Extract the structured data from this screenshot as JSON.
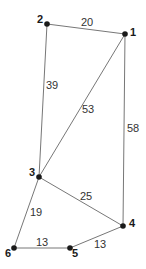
{
  "graph": {
    "nodes": [
      {
        "id": "1",
        "label": "1",
        "x": 125,
        "y": 34,
        "lx": 130,
        "ly": 36
      },
      {
        "id": "2",
        "label": "2",
        "x": 47,
        "y": 24,
        "lx": 37,
        "ly": 23
      },
      {
        "id": "3",
        "label": "3",
        "x": 39,
        "y": 177,
        "lx": 29,
        "ly": 176
      },
      {
        "id": "4",
        "label": "4",
        "x": 123,
        "y": 226,
        "lx": 129,
        "ly": 227
      },
      {
        "id": "5",
        "label": "5",
        "x": 70,
        "y": 248,
        "lx": 72,
        "ly": 257
      },
      {
        "id": "6",
        "label": "6",
        "x": 14,
        "y": 248,
        "lx": 5,
        "ly": 257
      }
    ],
    "edges": [
      {
        "from": "2",
        "to": "1",
        "weight": "20",
        "lx": 81,
        "ly": 26
      },
      {
        "from": "2",
        "to": "3",
        "weight": "39",
        "lx": 46,
        "ly": 89
      },
      {
        "from": "1",
        "to": "3",
        "weight": "53",
        "lx": 82,
        "ly": 113
      },
      {
        "from": "1",
        "to": "4",
        "weight": "58",
        "lx": 127,
        "ly": 132
      },
      {
        "from": "3",
        "to": "4",
        "weight": "25",
        "lx": 80,
        "ly": 200
      },
      {
        "from": "3",
        "to": "6",
        "weight": "19",
        "lx": 30,
        "ly": 216
      },
      {
        "from": "6",
        "to": "5",
        "weight": "13",
        "lx": 36,
        "ly": 246
      },
      {
        "from": "5",
        "to": "4",
        "weight": "13",
        "lx": 94,
        "ly": 248
      }
    ]
  }
}
